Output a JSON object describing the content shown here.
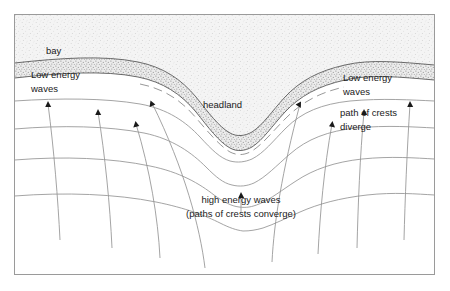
{
  "diagram": {
    "frame": {
      "border_color": "#9a9a9a",
      "background": "#ffffff"
    },
    "colors": {
      "land_fill": "#f2f2f2",
      "land_stipple": "#c9c9c9",
      "beach_fill": "#ededed",
      "beach_stipple": "#8d8d8d",
      "coastline": "#555555",
      "wave_crest": "#8c8c8c",
      "orthogonal_path": "#8c8c8c",
      "arrowhead": "#1a1a1a",
      "text": "#1a1a1a"
    },
    "labels": {
      "bay": "bay",
      "headland": "headland",
      "low_energy_left_line1": "Low energy",
      "low_energy_left_line2": "waves",
      "low_energy_right_line1": "Low energy",
      "low_energy_right_line2": "waves",
      "path_diverge_line1": "path of  crests",
      "path_diverge_line2": "diverge",
      "high_energy_line1": "high energy waves",
      "high_energy_line2": "(paths of crests converge)"
    },
    "features": {
      "landmass": "headland projecting seaward between two bays",
      "beach_strip": "stippled shoreline sediment band",
      "wave_crest_count": 4,
      "orthogonal_count": 8,
      "arrowhead_count": 8
    }
  }
}
